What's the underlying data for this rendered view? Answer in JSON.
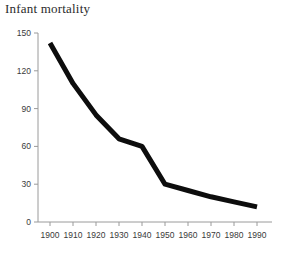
{
  "chart_data": {
    "type": "line",
    "title": "Infant mortality",
    "xlabel": "",
    "ylabel": "",
    "x": [
      1900,
      1910,
      1920,
      1930,
      1940,
      1950,
      1960,
      1970,
      1980,
      1990
    ],
    "values": [
      142,
      110,
      85,
      66,
      60,
      30,
      25,
      20,
      16,
      12
    ],
    "categories": [
      "1900",
      "1910",
      "1920",
      "1930",
      "1940",
      "1950",
      "1960",
      "1970",
      "1980",
      "1990"
    ],
    "xlim": [
      1896,
      1993
    ],
    "ylim": [
      0,
      150
    ],
    "y_ticks": [
      0,
      30,
      60,
      90,
      120,
      150
    ],
    "y_tick_labels": [
      "0",
      "30",
      "60",
      "90",
      "120",
      "150"
    ],
    "x_ticks": [
      1900,
      1910,
      1920,
      1930,
      1940,
      1950,
      1960,
      1970,
      1980,
      1990
    ],
    "x_tick_labels": [
      "1900",
      "1910",
      "1920",
      "1930",
      "1940",
      "1950",
      "1960",
      "1970",
      "1980",
      "1990"
    ],
    "grid": false,
    "legend": null,
    "series_color": "#0d0d0d",
    "axis_color": "#9a9a9a",
    "line_width": 5,
    "markers": false,
    "annotations": []
  }
}
